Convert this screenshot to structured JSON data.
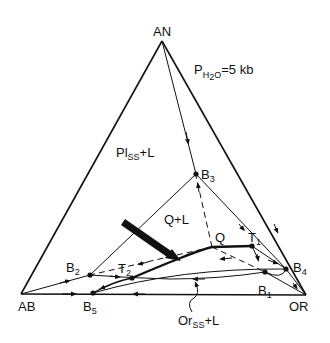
{
  "diagram": {
    "condition": {
      "prefix": "P",
      "subscript": "H2O",
      "sub_h": "H",
      "sub_2": "2",
      "sub_o": "O",
      "suffix": "=5 kb"
    },
    "vertices": {
      "an": {
        "label": "AN",
        "x": 162,
        "y": 41
      },
      "ab": {
        "label": "AB",
        "x": 21,
        "y": 294
      },
      "or": {
        "label": "OR",
        "x": 306,
        "y": 295
      }
    },
    "points": {
      "b1": {
        "label": "B",
        "sub": "1",
        "x": 265,
        "y": 272
      },
      "b2": {
        "label": "B",
        "sub": "2",
        "x": 90,
        "y": 275
      },
      "b3": {
        "label": "B",
        "sub": "3",
        "x": 196,
        "y": 174
      },
      "b4": {
        "label": "B",
        "sub": "4",
        "x": 286,
        "y": 269
      },
      "b5": {
        "label": "B",
        "sub": "5",
        "x": 93,
        "y": 293
      },
      "t1": {
        "label": "T",
        "sub": "1",
        "x": 252,
        "y": 246
      },
      "t2": {
        "label": "T",
        "sub": "2",
        "x": 132,
        "y": 278
      },
      "q": {
        "label": "Q",
        "x": 212,
        "y": 247
      }
    },
    "fields": {
      "plagioclase": {
        "main": "Pl",
        "sub": "SS",
        "suffix": "+L"
      },
      "quartz": {
        "text": "Q+L"
      },
      "orthoclase": {
        "main": "Or",
        "sub": "SS",
        "suffix": "+L"
      }
    },
    "colors": {
      "line": "#111111",
      "background": "#ffffff"
    }
  }
}
